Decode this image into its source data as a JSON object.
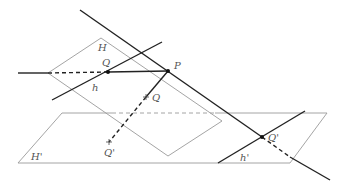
{
  "diagram": {
    "type": "geometry-projection",
    "colors": {
      "line": "#222222",
      "plane": "#9a9a9a",
      "label": "#555555",
      "background": "#ffffff"
    },
    "planes": [
      {
        "name": "H",
        "label": "H",
        "vertices": [
          [
            48,
            73
          ],
          [
            101,
            38
          ],
          [
            222,
            121
          ],
          [
            168,
            156
          ]
        ]
      },
      {
        "name": "H'",
        "label": "H'",
        "vertices": [
          [
            62,
            113
          ],
          [
            327,
            113
          ],
          [
            290,
            163
          ],
          [
            18,
            163
          ]
        ]
      }
    ],
    "points": [
      {
        "name": "P",
        "label": "P",
        "pos": [
          168,
          71
        ]
      },
      {
        "name": "Q",
        "label": "Q",
        "pos": [
          108,
          72
        ]
      },
      {
        "name": "Q-proj",
        "label": "Q",
        "pos": [
          146,
          97
        ]
      },
      {
        "name": "Q-prime-proj",
        "label": "Q'",
        "pos": [
          109,
          142
        ]
      },
      {
        "name": "Q-prime",
        "label": "Q'",
        "pos": [
          262,
          137
        ]
      }
    ],
    "lines": [
      {
        "name": "main-line",
        "from": [
          80,
          10
        ],
        "to": [
          330,
          180
        ]
      },
      {
        "name": "h",
        "label": "h",
        "from": [
          52,
          100
        ],
        "to": [
          162,
          42
        ]
      },
      {
        "name": "PQ",
        "from": [
          18,
          73
        ],
        "to": [
          168,
          71
        ]
      },
      {
        "name": "h-prime",
        "label": "h'",
        "from": [
          218,
          162
        ],
        "to": [
          305,
          111
        ]
      },
      {
        "name": "PQ-prime",
        "from": [
          168,
          71
        ],
        "to": [
          109,
          142
        ]
      }
    ],
    "labels": {
      "H": "H",
      "H_prime": "H'",
      "P": "P",
      "Q": "Q",
      "Q_mid": "Q",
      "Q_prime_low": "Q'",
      "Q_prime": "Q'",
      "h": "h",
      "h_prime": "h'"
    }
  }
}
